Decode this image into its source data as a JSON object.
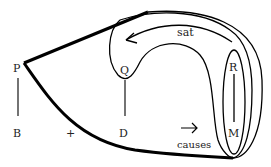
{
  "diagram": {
    "labels": {
      "P": "P",
      "B": "B",
      "Q": "Q",
      "D": "D",
      "R": "R",
      "M": "M",
      "plus": "+",
      "sat": "sat",
      "causes": "causes",
      "arrow": "→"
    },
    "colors": {
      "stroke": "#000000",
      "text": "#222222",
      "background": "#ffffff"
    }
  }
}
